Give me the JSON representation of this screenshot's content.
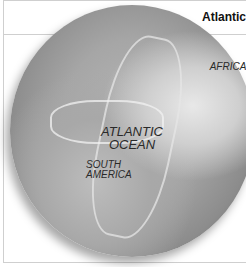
{
  "header": {
    "title": "Atlantic"
  },
  "figure": {
    "labels": {
      "africa": "AFRICA",
      "ocean_line1": "ATLANTIC",
      "ocean_line2": "OCEAN",
      "south_america_line1": "SOUTH",
      "south_america_line2": "AMERICA"
    }
  },
  "colors": {
    "frame": "#cfcfcf",
    "title": "#111111",
    "label": "#2a2a2a"
  }
}
